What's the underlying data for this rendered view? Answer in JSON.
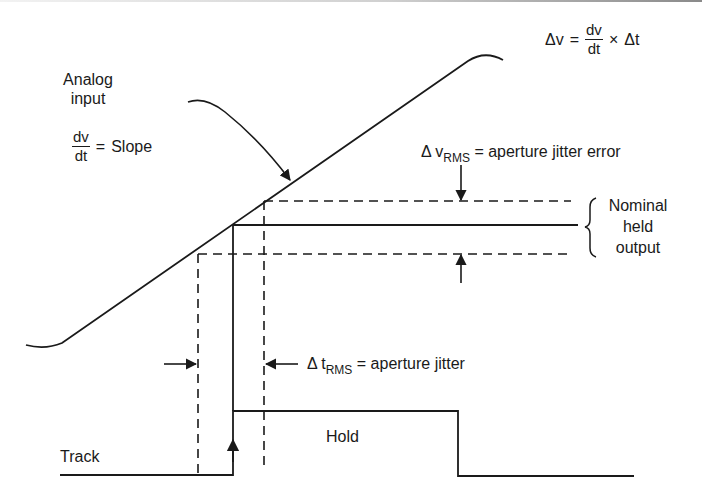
{
  "diagram": {
    "formula": {
      "lhs": "Δv",
      "eq": "=",
      "frac_num": "dv",
      "frac_den": "dt",
      "times": "×",
      "rhs": "Δt"
    },
    "analog_input": {
      "line1": "Analog",
      "line2": "input",
      "slope_num": "dv",
      "slope_den": "dt",
      "slope_eq": "=",
      "slope_word": "Slope"
    },
    "aperture_error": {
      "delta": "Δ v",
      "sub": "RMS",
      "text": "= aperture jitter error"
    },
    "nominal_output": {
      "line1": "Nominal",
      "line2": "held",
      "line3": "output"
    },
    "aperture_jitter": {
      "delta": "Δ t",
      "sub": "RMS",
      "text": "= aperture jitter"
    },
    "signal_labels": {
      "track": "Track",
      "hold": "Hold"
    },
    "colors": {
      "ink": "#1a1a1a",
      "background": "#ffffff"
    }
  }
}
